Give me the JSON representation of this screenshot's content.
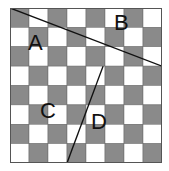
{
  "diagram": {
    "grid": {
      "rows": 8,
      "cols": 8,
      "dark_color": "#8a8a8a",
      "light_color": "#ffffff",
      "border_color": "#555555",
      "first_cell_dark": true
    },
    "lines": [
      {
        "id": "line-1",
        "from": [
          0,
          0
        ],
        "to": [
          8,
          3
        ]
      },
      {
        "id": "line-2",
        "from": [
          4.9,
          3
        ],
        "to": [
          3,
          8
        ]
      }
    ],
    "labels": [
      {
        "text": "A",
        "x": 27,
        "y": 42
      },
      {
        "text": "B",
        "x": 113,
        "y": 22
      },
      {
        "text": "C",
        "x": 40,
        "y": 110
      },
      {
        "text": "D",
        "x": 92,
        "y": 120
      }
    ]
  }
}
